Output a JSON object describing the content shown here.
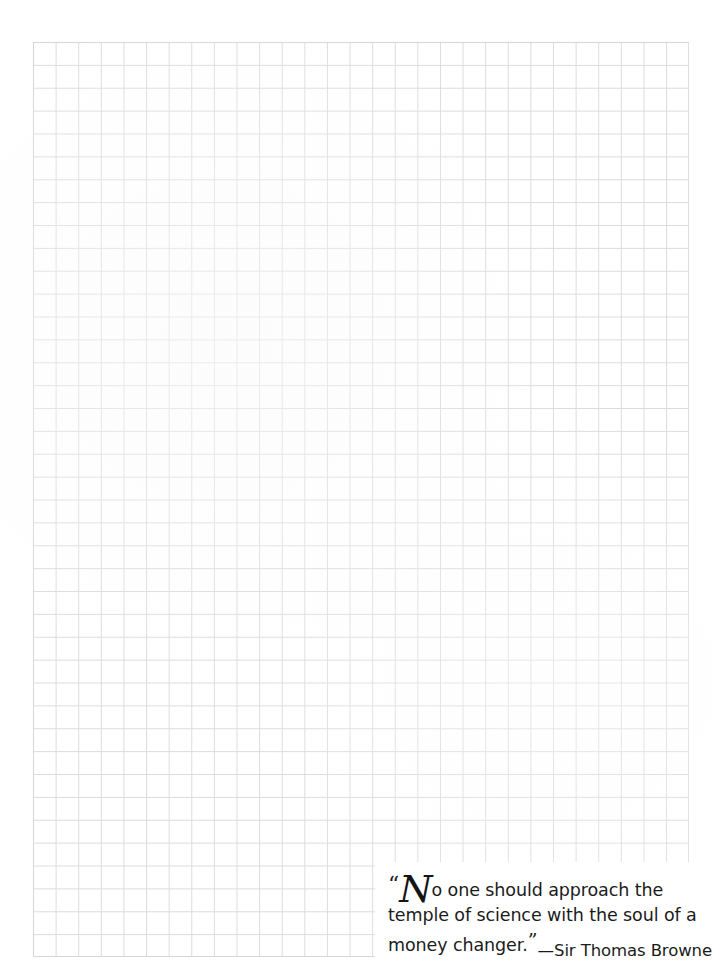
{
  "page": {
    "background_color": "#ffffff",
    "width": 728,
    "height": 972
  },
  "grid": {
    "name": "graph-paper-grid",
    "line_color": "#dcdcdc",
    "cell_width": 22.62,
    "cell_height": 22.88,
    "columns": 29,
    "rows": 40,
    "left": 33,
    "top": 42,
    "width": 656,
    "height": 915
  },
  "quote": {
    "open_quote_mark": "“",
    "drop_cap": "N",
    "line1_rest": "o one should approach the temple",
    "line2": "of science with the soul of a money",
    "line3": "changer.",
    "close_quote_mark": "”",
    "full_text": "“No one should approach the temple of science with the soul of a money changer.”",
    "attribution": "—Sir Thomas Browne",
    "text_color": "#1b1b1b"
  }
}
